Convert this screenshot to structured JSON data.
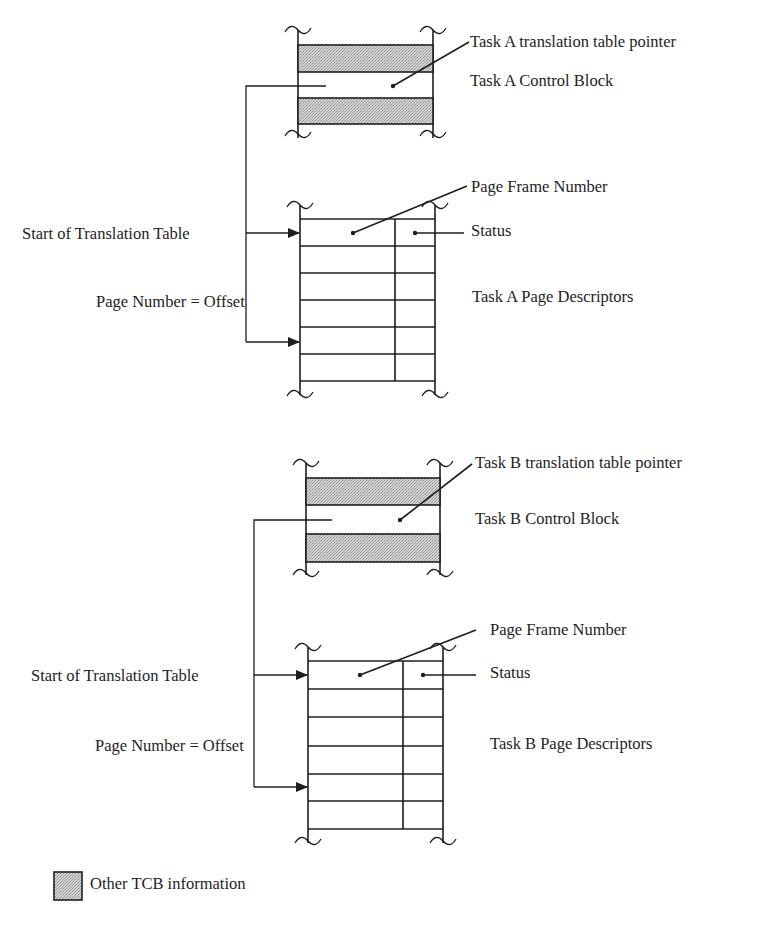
{
  "diagram": {
    "type": "memory translation table diagram",
    "colors": {
      "ink": "#1e1e1e",
      "shade": "#c9c9c9",
      "background": "#ffffff"
    },
    "task_a": {
      "pointer_label": "Task A translation table pointer",
      "tcb_label": "Task A Control Block",
      "page_frame_label": "Page Frame Number",
      "status_label": "Status",
      "start_label": "Start of Translation Table",
      "offset_label": "Page Number = Offset",
      "descriptors_label": "Task A Page Descriptors",
      "descriptor_rows": 6
    },
    "task_b": {
      "pointer_label": "Task B translation table pointer",
      "tcb_label": "Task B Control Block",
      "page_frame_label": "Page Frame Number",
      "status_label": "Status",
      "start_label": "Start of Translation Table",
      "offset_label": "Page Number = Offset",
      "descriptors_label": "Task B Page Descriptors",
      "descriptor_rows": 6
    },
    "legend": {
      "shaded_label": "Other TCB information"
    }
  }
}
